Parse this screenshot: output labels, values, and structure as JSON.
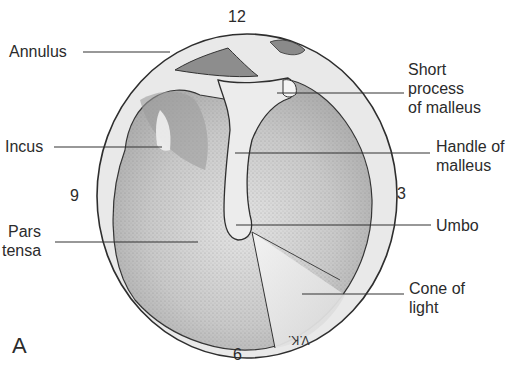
{
  "figure": {
    "panel_letter": "A",
    "clock_positions": {
      "top": "12",
      "right": "3",
      "bottom": "6",
      "left": "9"
    },
    "artist_initials": "V.K.",
    "labels": [
      {
        "id": "annulus",
        "text": "Annulus",
        "side": "left"
      },
      {
        "id": "incus",
        "text": "Incus",
        "side": "left"
      },
      {
        "id": "pars-tensa",
        "lines": [
          "Pars",
          "tensa"
        ],
        "side": "left"
      },
      {
        "id": "short-process",
        "lines": [
          "Short",
          "process",
          "of malleus"
        ],
        "side": "right"
      },
      {
        "id": "handle-malleus",
        "lines": [
          "Handle of",
          "malleus"
        ],
        "side": "right"
      },
      {
        "id": "umbo",
        "text": "Umbo",
        "side": "right"
      },
      {
        "id": "cone-of-light",
        "lines": [
          "Cone of",
          "light"
        ],
        "side": "right"
      }
    ]
  },
  "labels": {
    "annulus": "Annulus",
    "incus": "Incus",
    "pars_tensa_1": "Pars",
    "pars_tensa_2": "tensa",
    "short_1": "Short",
    "short_2": "process",
    "short_3": "of malleus",
    "handle_1": "Handle of",
    "handle_2": "malleus",
    "umbo": "Umbo",
    "cone_1": "Cone of",
    "cone_2": "light"
  },
  "clock": {
    "twelve": "12",
    "three": "3",
    "six": "6",
    "nine": "9"
  },
  "panel": "A",
  "initials": "V.K."
}
